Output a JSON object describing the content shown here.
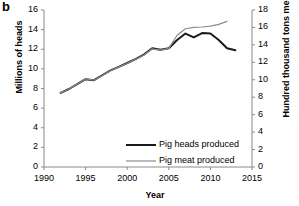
{
  "panel": {
    "label": "b"
  },
  "chart_data": {
    "type": "line",
    "title": "",
    "xlabel": "Year",
    "ylabel": "Millions of heads",
    "y2label": "Hundred thousand tons meat",
    "xlim": [
      1990,
      2015
    ],
    "ylim": [
      0,
      16
    ],
    "y2lim": [
      0,
      18
    ],
    "xticks": [
      1990,
      1995,
      2000,
      2005,
      2010,
      2015
    ],
    "yticks": [
      0,
      2,
      4,
      6,
      8,
      10,
      12,
      14,
      16
    ],
    "y2ticks": [
      0,
      2,
      4,
      6,
      8,
      10,
      12,
      14,
      16,
      18
    ],
    "grid": false,
    "legend_position": "lower-center-right",
    "x": [
      1992,
      1993,
      1994,
      1995,
      1996,
      1997,
      1998,
      1999,
      2000,
      2001,
      2002,
      2003,
      2004,
      2005,
      2006,
      2007,
      2008,
      2009,
      2010,
      2011,
      2012,
      2013
    ],
    "series": [
      {
        "name": "Pig heads produced",
        "axis": "left",
        "color": "#1a1a1a",
        "width": 2.0,
        "values": [
          7.55,
          7.95,
          8.45,
          8.95,
          8.85,
          9.35,
          9.85,
          10.2,
          10.6,
          11.0,
          11.45,
          12.1,
          11.95,
          12.1,
          12.95,
          13.6,
          13.2,
          13.65,
          13.6,
          12.95,
          12.1,
          11.9
        ]
      },
      {
        "name": "Pig meat produced",
        "axis": "right",
        "color": "#8c8c8c",
        "width": 1.2,
        "values": [
          8.5,
          8.95,
          9.5,
          10.1,
          9.95,
          10.5,
          11.05,
          11.45,
          11.9,
          12.35,
          12.85,
          13.55,
          13.4,
          13.6,
          15.1,
          15.85,
          16.0,
          16.05,
          16.15,
          16.35,
          16.7,
          null
        ]
      }
    ]
  },
  "legend": {
    "items": [
      {
        "label": "Pig heads produced",
        "color": "#1a1a1a",
        "width": 2.0
      },
      {
        "label": "Pig meat produced",
        "color": "#8c8c8c",
        "width": 1.2
      }
    ]
  }
}
